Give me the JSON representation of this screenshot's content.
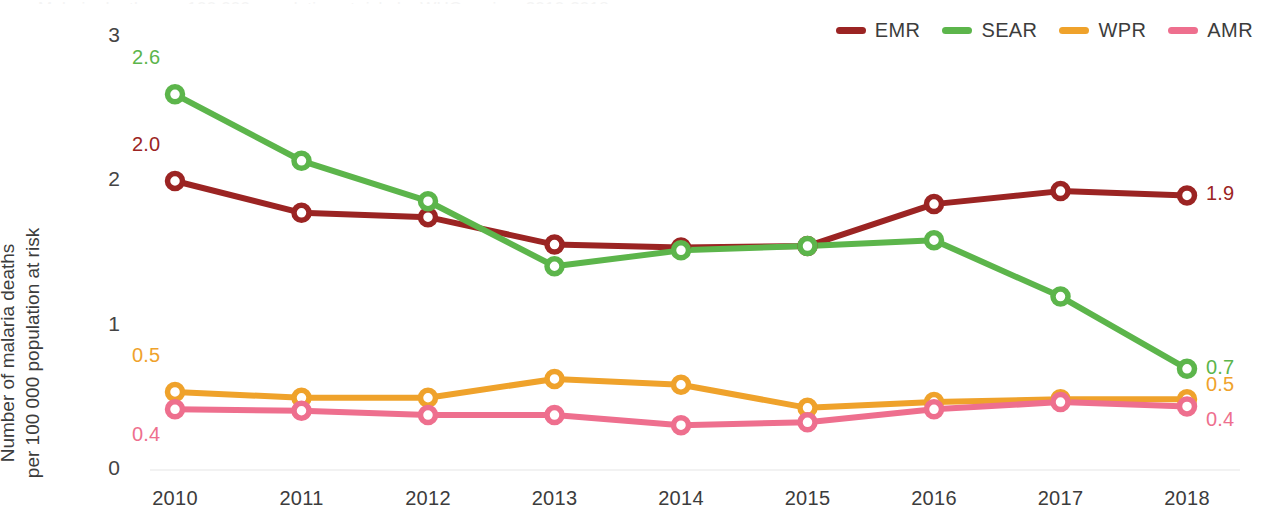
{
  "figure": {
    "title_sliver": "Malaria deaths per 100 000 population at risk, by WHO region, 2010-2018",
    "y_axis_title_line1": "Number of malaria deaths",
    "y_axis_title_line2": "per 100 000 population at risk"
  },
  "legend": {
    "position": "top-right",
    "items": [
      {
        "label": "EMR",
        "color": "#9B2423"
      },
      {
        "label": "SEAR",
        "color": "#5CB54B"
      },
      {
        "label": "WPR",
        "color": "#EFA22B"
      },
      {
        "label": "AMR",
        "color": "#EE6F8E"
      }
    ]
  },
  "axes": {
    "y_ticks": [
      "0",
      "1",
      "2",
      "3"
    ],
    "x_ticks": [
      "2010",
      "2011",
      "2012",
      "2013",
      "2014",
      "2015",
      "2016",
      "2017",
      "2018"
    ]
  },
  "annotations": {
    "start": [
      {
        "series": "SEAR",
        "text": "2.6",
        "color": "#5CB54B"
      },
      {
        "series": "EMR",
        "text": "2.0",
        "color": "#9B2423"
      },
      {
        "series": "WPR",
        "text": "0.5",
        "color": "#EFA22B"
      },
      {
        "series": "AMR",
        "text": "0.4",
        "color": "#EE6F8E"
      }
    ],
    "end": [
      {
        "series": "EMR",
        "text": "1.9",
        "color": "#9B2423"
      },
      {
        "series": "SEAR",
        "text": "0.7",
        "color": "#5CB54B"
      },
      {
        "series": "WPR",
        "text": "0.5",
        "color": "#EFA22B"
      },
      {
        "series": "AMR",
        "text": "0.4",
        "color": "#EE6F8E"
      }
    ]
  },
  "chart_data": {
    "type": "line",
    "xlabel": "",
    "ylabel": "Number of malaria deaths per 100 000 population at risk",
    "x": [
      2010,
      2011,
      2012,
      2013,
      2014,
      2015,
      2016,
      2017,
      2018
    ],
    "ylim": [
      0,
      3
    ],
    "yticks": [
      0,
      1,
      2,
      3
    ],
    "grid": false,
    "legend_position": "top-right",
    "markers": "open-circle",
    "series": [
      {
        "name": "EMR",
        "color": "#9B2423",
        "values": [
          2.0,
          1.78,
          1.75,
          1.56,
          1.54,
          1.55,
          1.84,
          1.93,
          1.9
        ],
        "start_label": "2.0",
        "end_label": "1.9"
      },
      {
        "name": "SEAR",
        "color": "#5CB54B",
        "values": [
          2.6,
          2.14,
          1.86,
          1.41,
          1.52,
          1.55,
          1.59,
          1.2,
          0.7
        ],
        "start_label": "2.6",
        "end_label": "0.7"
      },
      {
        "name": "WPR",
        "color": "#EFA22B",
        "values": [
          0.54,
          0.5,
          0.5,
          0.63,
          0.59,
          0.43,
          0.47,
          0.49,
          0.49
        ],
        "start_label": "0.5",
        "end_label": "0.5"
      },
      {
        "name": "AMR",
        "color": "#EE6F8E",
        "values": [
          0.42,
          0.41,
          0.38,
          0.38,
          0.31,
          0.33,
          0.42,
          0.47,
          0.44
        ],
        "start_label": "0.4",
        "end_label": "0.4"
      }
    ]
  }
}
